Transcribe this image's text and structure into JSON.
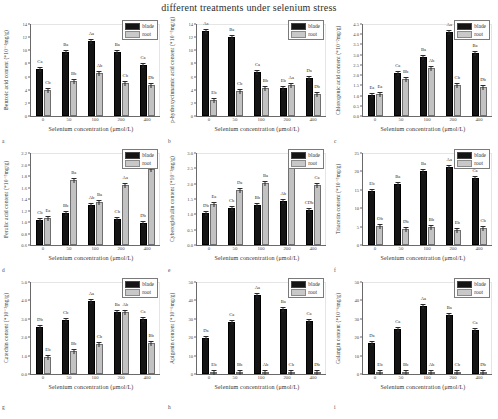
{
  "figure": {
    "title": "different treatments under selenium stress",
    "xlabel": "Selenium concentration (μmol/L)",
    "legend": {
      "blade": "blade",
      "root": "root"
    },
    "categories": [
      "0",
      "50",
      "100",
      "200",
      "400"
    ]
  },
  "chart_data": [
    {
      "panel": "a",
      "type": "bar",
      "title": "",
      "ylabel": "Benzoic acid content (*10⁻⁴mg/g)",
      "xlabel": "Selenium concentration (μmol/L)",
      "categories": [
        "0",
        "50",
        "100",
        "200",
        "400"
      ],
      "ylim": [
        0,
        14
      ],
      "yticks": [
        0,
        2,
        4,
        6,
        8,
        10,
        12,
        14
      ],
      "series": [
        {
          "name": "blade",
          "values": [
            7.2,
            9.7,
            11.4,
            9.7,
            7.8
          ],
          "errors": [
            0.5,
            0.4,
            0.4,
            0.4,
            0.6
          ],
          "labels": [
            "Ca",
            "Ba",
            "Aa",
            "Ba",
            "Ca"
          ]
        },
        {
          "name": "root",
          "values": [
            4.0,
            5.3,
            6.5,
            5.1,
            4.7
          ],
          "errors": [
            0.3,
            0.2,
            0.3,
            0.2,
            0.2
          ],
          "labels": [
            "Cb",
            "Bb",
            "Ab",
            "Cb",
            "Db"
          ]
        }
      ]
    },
    {
      "panel": "b",
      "type": "bar",
      "title": "",
      "ylabel": "p-hydroxycinnamic acid content (*10⁻³mg/g)",
      "xlabel": "Selenium concentration (μmol/L)",
      "categories": [
        "0",
        "50",
        "100",
        "200",
        "400"
      ],
      "ylim": [
        0,
        14
      ],
      "yticks": [
        0,
        2,
        4,
        6,
        8,
        10,
        12,
        14
      ],
      "series": [
        {
          "name": "blade",
          "values": [
            12.9,
            12.0,
            6.7,
            4.2,
            5.8
          ],
          "errors": [
            0.4,
            0.3,
            0.5,
            0.3,
            0.4
          ],
          "labels": [
            "Aa",
            "Ba",
            "Ca",
            "Eb",
            "Da"
          ]
        },
        {
          "name": "root",
          "values": [
            2.4,
            3.8,
            4.3,
            4.7,
            3.4
          ],
          "errors": [
            0.2,
            0.2,
            0.2,
            0.2,
            0.2
          ],
          "labels": [
            "Eb",
            "Cb",
            "Bb",
            "Aa",
            "Db"
          ]
        }
      ]
    },
    {
      "panel": "c",
      "type": "bar",
      "title": "",
      "ylabel": "Chlorogenic acid content (*10⁻²mg/g)",
      "xlabel": "Selenium concentration (μmol/L)",
      "categories": [
        "0",
        "50",
        "100",
        "200",
        "400"
      ],
      "ylim": [
        0,
        4.5
      ],
      "yticks": [
        0.0,
        0.5,
        1.0,
        1.5,
        2.0,
        2.5,
        3.0,
        3.5,
        4.0,
        4.5
      ],
      "series": [
        {
          "name": "blade",
          "values": [
            1.05,
            2.1,
            2.9,
            4.1,
            3.1
          ],
          "errors": [
            0.1,
            0.12,
            0.15,
            0.2,
            0.18
          ],
          "labels": [
            "Ea",
            "Ca",
            "Ba",
            "Aa",
            "Ba"
          ]
        },
        {
          "name": "root",
          "values": [
            1.1,
            1.8,
            2.35,
            1.5,
            1.4
          ],
          "errors": [
            0.1,
            0.1,
            0.1,
            0.1,
            0.1
          ],
          "labels": [
            "Ea",
            "Bb",
            "Ab",
            "Cb",
            "Db"
          ]
        }
      ]
    },
    {
      "panel": "d",
      "type": "bar",
      "title": "",
      "ylabel": "Ferulic acid content (*10⁻³mg/g)",
      "xlabel": "Selenium concentration (μmol/L)",
      "categories": [
        "0",
        "50",
        "100",
        "200",
        "400"
      ],
      "ylim": [
        0.6,
        2.2
      ],
      "yticks": [
        0.6,
        0.8,
        1.0,
        1.2,
        1.4,
        1.6,
        1.8,
        2.0,
        2.2
      ],
      "series": [
        {
          "name": "blade",
          "values": [
            1.03,
            1.15,
            1.29,
            1.05,
            0.98
          ],
          "errors": [
            0.03,
            0.03,
            0.03,
            0.03,
            0.03
          ],
          "labels": [
            "Cb",
            "Bb",
            "Ab",
            "Cb",
            "Db"
          ]
        },
        {
          "name": "root",
          "values": [
            1.07,
            1.73,
            1.35,
            1.65,
            1.92
          ],
          "errors": [
            0.03,
            0.04,
            0.04,
            0.05,
            0.05
          ],
          "labels": [
            "Ea",
            "Ba",
            "Ba",
            "Aa",
            "Ca"
          ]
        }
      ]
    },
    {
      "panel": "e",
      "type": "bar",
      "title": "",
      "ylabel": "Cyberoglobulin content (*10⁻³mg/g)",
      "xlabel": "Selenium concentration (μmol/L)",
      "categories": [
        "0",
        "50",
        "100",
        "200",
        "400"
      ],
      "ylim": [
        0,
        3.0
      ],
      "yticks": [
        0.0,
        0.5,
        1.0,
        1.5,
        2.0,
        2.5,
        3.0
      ],
      "series": [
        {
          "name": "blade",
          "values": [
            1.05,
            1.22,
            1.32,
            1.42,
            1.15
          ],
          "errors": [
            0.04,
            0.04,
            0.04,
            0.05,
            0.04
          ],
          "labels": [
            "Db",
            "Cb",
            "Bb",
            "Ab",
            "CDb"
          ]
        },
        {
          "name": "root",
          "values": [
            1.33,
            1.8,
            2.03,
            2.62,
            1.95
          ],
          "errors": [
            0.05,
            0.06,
            0.06,
            0.08,
            0.07
          ],
          "labels": [
            "Ea",
            "Da",
            "Ba",
            "Aa",
            "Ca"
          ]
        }
      ]
    },
    {
      "panel": "f",
      "type": "bar",
      "title": "",
      "ylabel": "Triacetin content (*10⁻³mg/g)",
      "xlabel": "Selenium concentration (μmol/L)",
      "categories": [
        "0",
        "50",
        "100",
        "200",
        "400"
      ],
      "ylim": [
        0,
        25
      ],
      "yticks": [
        0,
        5,
        10,
        15,
        20,
        25
      ],
      "series": [
        {
          "name": "blade",
          "values": [
            14.7,
            16.5,
            20.0,
            21.2,
            18.2
          ],
          "errors": [
            0.5,
            0.5,
            0.5,
            0.6,
            0.6
          ],
          "labels": [
            "Eb",
            "Ba",
            "Ba",
            "Aa",
            "Ca"
          ]
        },
        {
          "name": "root",
          "values": [
            5.3,
            4.4,
            5.0,
            4.1,
            4.7
          ],
          "errors": [
            0.2,
            0.2,
            0.2,
            0.2,
            0.2
          ],
          "labels": [
            "Ob",
            "Db",
            "Bb",
            "Eb",
            "Cb"
          ]
        }
      ]
    },
    {
      "panel": "g",
      "type": "bar",
      "title": "",
      "ylabel": "Catechin content (*10⁻³mg/g)",
      "xlabel": "Selenium concentration (μmol/L)",
      "categories": [
        "0",
        "50",
        "100",
        "200",
        "400"
      ],
      "ylim": [
        0,
        5
      ],
      "yticks": [
        0,
        1,
        2,
        3,
        4,
        5
      ],
      "series": [
        {
          "name": "blade",
          "values": [
            2.55,
            2.95,
            3.95,
            3.35,
            2.98
          ],
          "errors": [
            0.1,
            0.1,
            0.12,
            0.12,
            0.12
          ],
          "labels": [
            "Db",
            "Cb",
            "Aa",
            "Ba",
            "Ca"
          ]
        },
        {
          "name": "root",
          "values": [
            0.95,
            1.25,
            1.65,
            3.35,
            1.7
          ],
          "errors": [
            0.06,
            0.06,
            0.08,
            0.12,
            0.08
          ],
          "labels": [
            "Eb",
            "Bb",
            "Cb",
            "Ab",
            "Bb"
          ]
        }
      ]
    },
    {
      "panel": "h",
      "type": "bar",
      "title": "",
      "ylabel": "Apigenin content (*10⁻⁶mg/g)",
      "xlabel": "Selenium concentration (μmol/L)",
      "categories": [
        "0",
        "50",
        "100",
        "200",
        "400"
      ],
      "ylim": [
        0,
        50
      ],
      "yticks": [
        0,
        10,
        20,
        30,
        40,
        50
      ],
      "series": [
        {
          "name": "blade",
          "values": [
            19.5,
            28.5,
            43.0,
            35.5,
            28.8
          ],
          "errors": [
            1.0,
            1.0,
            1.5,
            1.2,
            1.2
          ],
          "labels": [
            "Da",
            "Ca",
            "Aa",
            "Ba",
            "Ca"
          ]
        },
        {
          "name": "root",
          "values": [
            0.8,
            0.9,
            1.1,
            0.8,
            0.8
          ],
          "errors": [
            0.1,
            0.1,
            0.1,
            0.1,
            0.1
          ],
          "labels": [
            "Eb",
            "Bb",
            "Ab",
            "Cb",
            "Db"
          ]
        }
      ]
    },
    {
      "panel": "i",
      "type": "bar",
      "title": "",
      "ylabel": "Galangin content (*10⁻⁶mg/g)",
      "xlabel": "Selenium concentration (μmol/L)",
      "categories": [
        "0",
        "50",
        "100",
        "200",
        "400"
      ],
      "ylim": [
        0,
        50
      ],
      "yticks": [
        0,
        10,
        20,
        30,
        40,
        50
      ],
      "series": [
        {
          "name": "blade",
          "values": [
            17.0,
            24.5,
            37.0,
            32.0,
            24.0
          ],
          "errors": [
            0.8,
            1.0,
            1.5,
            1.2,
            1.0
          ],
          "labels": [
            "Da",
            "Ca",
            "Aa",
            "Ba",
            "Ca"
          ]
        },
        {
          "name": "root",
          "values": [
            0.9,
            1.0,
            1.0,
            0.8,
            0.8
          ],
          "errors": [
            0.1,
            0.1,
            0.1,
            0.1,
            0.1
          ],
          "labels": [
            "Eb",
            "Bb",
            "Ab",
            "Cb",
            "Db"
          ]
        }
      ]
    }
  ]
}
